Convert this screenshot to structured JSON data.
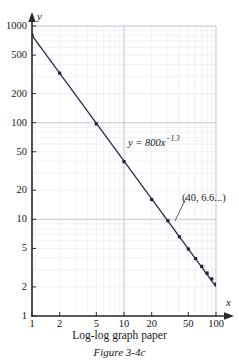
{
  "figure": {
    "caption_main": "Log-log graph paper",
    "caption_figure": "Figure 3-4c"
  },
  "chart_data": {
    "type": "line",
    "title": "",
    "subtitle": "",
    "xlabel": "x",
    "ylabel": "y",
    "xscale": "log",
    "yscale": "log",
    "xlim": [
      1,
      100
    ],
    "ylim": [
      1,
      1000
    ],
    "grid": true,
    "grid_style": "log-log graph paper (major decade lines plus logarithmic minor lines)",
    "legend": "none",
    "x_tick_labels": [
      "1",
      "2",
      "5",
      "10",
      "20",
      "50",
      "100"
    ],
    "x_tick_values": [
      1,
      2,
      5,
      10,
      20,
      50,
      100
    ],
    "y_tick_labels": [
      "1000",
      "500",
      "200",
      "100",
      "50",
      "20",
      "10",
      "5",
      "2",
      "1"
    ],
    "y_tick_values": [
      1000,
      500,
      200,
      100,
      50,
      20,
      10,
      5,
      2,
      1
    ],
    "series": [
      {
        "name": "y = 800x^-1.3",
        "equation": "y = 800x^(-1.3)",
        "color": "#2b2b4e",
        "marker": "square",
        "x": [
          1,
          2,
          5,
          10,
          20,
          30,
          40,
          50,
          60,
          70,
          80,
          90,
          100
        ],
        "values": [
          800,
          325,
          97.1,
          39.5,
          16.0,
          9.68,
          6.6,
          4.93,
          3.93,
          3.26,
          2.78,
          2.42,
          2.14
        ]
      }
    ],
    "annotations": [
      {
        "name": "equation-label",
        "text": "y = 800x",
        "exponent": "−1.3",
        "full_text": "y = 800x⁻¹·³"
      },
      {
        "name": "point-annotation",
        "text": "(40, 6.6...)",
        "points_to_x": 40,
        "points_to_y": 6.6
      }
    ]
  },
  "axes": {
    "x_axis_name": "x",
    "y_axis_name": "y"
  }
}
